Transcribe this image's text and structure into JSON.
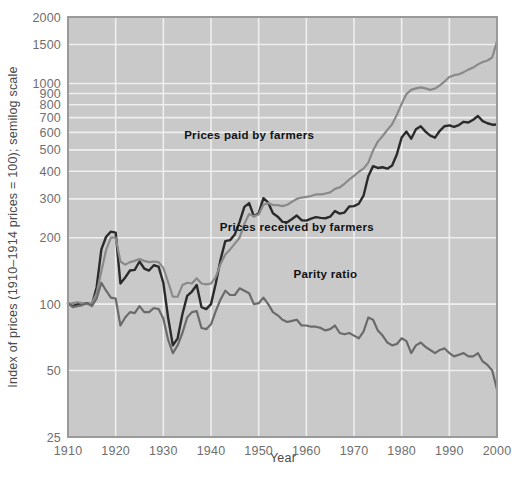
{
  "chart_data": {
    "type": "line",
    "title": "",
    "xlabel": "Year",
    "ylabel": "Index of prices (1910–1914 prices = 100); semilog scale",
    "scale": "semilog",
    "grid": true,
    "legend_position": "inline-annotations",
    "plot_background": "#c9c9c9",
    "figure_background": "#ffffff",
    "xlim": [
      1910,
      2000
    ],
    "ylim": [
      25,
      2000
    ],
    "xticks": [
      1910,
      1920,
      1930,
      1940,
      1950,
      1960,
      1970,
      1980,
      1990,
      2000
    ],
    "xtick_labels": [
      "1910",
      "1920",
      "1930",
      "1940",
      "1950",
      "1960",
      "1970",
      "1980",
      "1990",
      "2000"
    ],
    "yticks": [
      25,
      50,
      100,
      200,
      300,
      400,
      500,
      600,
      700,
      800,
      900,
      1000,
      1500,
      2000
    ],
    "ytick_labels": [
      "25",
      "50",
      "100",
      "200",
      "300",
      "400",
      "500",
      "600",
      "700",
      "800",
      "900",
      "1000",
      "1500",
      "2000"
    ],
    "gridlines_y": [
      50,
      100,
      200,
      300,
      400,
      500,
      600,
      700,
      800,
      900,
      1000,
      1500,
      2000
    ],
    "x": [
      1910,
      1911,
      1912,
      1913,
      1914,
      1915,
      1916,
      1917,
      1918,
      1919,
      1920,
      1921,
      1922,
      1923,
      1924,
      1925,
      1926,
      1927,
      1928,
      1929,
      1930,
      1931,
      1932,
      1933,
      1934,
      1935,
      1936,
      1937,
      1938,
      1939,
      1940,
      1941,
      1942,
      1943,
      1944,
      1945,
      1946,
      1947,
      1948,
      1949,
      1950,
      1951,
      1952,
      1953,
      1954,
      1955,
      1956,
      1957,
      1958,
      1959,
      1960,
      1961,
      1962,
      1963,
      1964,
      1965,
      1966,
      1967,
      1968,
      1969,
      1970,
      1971,
      1972,
      1973,
      1974,
      1975,
      1976,
      1977,
      1978,
      1979,
      1980,
      1981,
      1982,
      1983,
      1984,
      1985,
      1986,
      1987,
      1988,
      1989,
      1990,
      1991,
      1992,
      1993,
      1994,
      1995,
      1996,
      1997,
      1998,
      1999,
      2000
    ],
    "series": [
      {
        "name": "Prices received by farmers",
        "color": "#2b2b2b",
        "label_text": "Prices received by farmers",
        "label_x": 1958,
        "label_y": 215,
        "values": [
          101,
          98,
          100,
          100,
          101,
          99,
          119,
          177,
          202,
          213,
          211,
          124,
          132,
          142,
          143,
          156,
          145,
          142,
          150,
          148,
          125,
          87,
          65,
          70,
          90,
          109,
          114,
          122,
          97,
          95,
          100,
          124,
          159,
          193,
          195,
          207,
          236,
          276,
          287,
          250,
          258,
          302,
          288,
          258,
          249,
          236,
          235,
          243,
          252,
          240,
          239,
          244,
          248,
          246,
          245,
          249,
          264,
          257,
          260,
          277,
          278,
          285,
          310,
          380,
          422,
          414,
          417,
          411,
          425,
          478,
          569,
          605,
          562,
          620,
          640,
          605,
          580,
          568,
          610,
          640,
          646,
          635,
          648,
          670,
          665,
          685,
          712,
          675,
          660,
          650,
          652
        ]
      },
      {
        "name": "Prices paid by farmers",
        "color": "#8a8a8a",
        "label_text": "Prices paid by farmers",
        "label_x": 1948,
        "label_y": 560,
        "values": [
          100,
          101,
          102,
          101,
          100,
          101,
          112,
          141,
          176,
          200,
          200,
          156,
          151,
          155,
          157,
          160,
          157,
          155,
          156,
          155,
          146,
          126,
          108,
          108,
          122,
          125,
          124,
          131,
          124,
          123,
          124,
          133,
          152,
          168,
          177,
          188,
          200,
          231,
          256,
          250,
          255,
          282,
          287,
          281,
          281,
          278,
          282,
          291,
          300,
          304,
          306,
          309,
          314,
          314,
          317,
          321,
          333,
          338,
          351,
          367,
          381,
          398,
          411,
          438,
          497,
          545,
          578,
          616,
          653,
          722,
          809,
          895,
          935,
          950,
          960,
          950,
          935,
          948,
          980,
          1020,
          1070,
          1090,
          1100,
          1125,
          1155,
          1180,
          1220,
          1250,
          1270,
          1310,
          1550
        ]
      },
      {
        "name": "Parity ratio",
        "color": "#6b6b6b",
        "label_text": "Parity ratio",
        "label_x": 1964,
        "label_y": 131,
        "values": [
          101,
          97,
          98,
          99,
          101,
          98,
          106,
          125,
          115,
          107,
          106,
          80,
          87,
          92,
          91,
          98,
          92,
          92,
          96,
          95,
          86,
          69,
          60,
          65,
          74,
          87,
          92,
          93,
          78,
          77,
          81,
          93,
          105,
          115,
          110,
          110,
          118,
          115,
          112,
          100,
          101,
          107,
          100,
          92,
          89,
          85,
          83,
          84,
          85,
          80,
          80,
          79,
          79,
          78,
          76,
          77,
          80,
          74,
          73,
          74,
          72,
          70,
          75,
          87,
          85,
          76,
          72,
          67,
          65,
          66,
          70,
          68,
          60,
          65,
          67,
          64,
          62,
          60,
          62,
          63,
          60,
          58,
          59,
          60,
          58,
          58,
          60,
          55,
          53,
          50,
          41
        ]
      }
    ]
  },
  "annotations": {
    "prices_paid_label": "Prices paid by farmers",
    "prices_received_label": "Prices received by farmers",
    "parity_ratio_label": "Parity ratio"
  }
}
